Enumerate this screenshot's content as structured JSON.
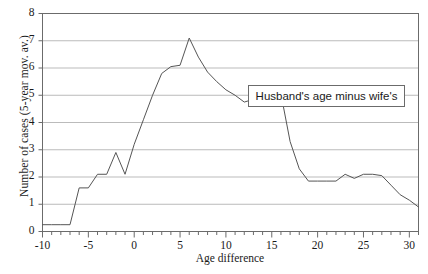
{
  "chart_data": {
    "type": "line",
    "title": "",
    "subtitle": "",
    "xlabel": "Age difference",
    "ylabel": "Number of cases (5-year mov. av.)",
    "xlim": [
      -10,
      31
    ],
    "ylim": [
      0,
      8
    ],
    "xticks": [
      -10,
      -5,
      0,
      5,
      10,
      15,
      20,
      25,
      30
    ],
    "xtick_labels": [
      "-10",
      "-5",
      "0",
      "5",
      "10",
      "15",
      "20",
      "25",
      "30"
    ],
    "x_minor_tick_interval": 1,
    "yticks": [
      0,
      1,
      2,
      3,
      4,
      5,
      6,
      7,
      8
    ],
    "ytick_labels": [
      "0",
      "1",
      "2",
      "3",
      "4",
      "5",
      "6",
      "7",
      "8"
    ],
    "grid": "horizontal",
    "legend": {
      "position": "inside-upper-right",
      "entries": [
        "Husband's age minus wife's"
      ]
    },
    "annotations": [
      {
        "text": "Husband's age minus wife's",
        "x": 20.5,
        "y": 5.05,
        "boxed": true
      }
    ],
    "series": [
      {
        "name": "Husband's age minus wife's",
        "color": "#555555",
        "line_width": 1,
        "x": [
          -10,
          -9,
          -8,
          -7,
          -6,
          -5,
          -4,
          -3,
          -2,
          -1,
          0,
          1,
          2,
          3,
          4,
          5,
          6,
          7,
          8,
          9,
          10,
          11,
          12,
          13,
          14,
          15,
          16,
          17,
          18,
          19,
          20,
          21,
          22,
          23,
          24,
          25,
          26,
          27,
          28,
          29,
          30,
          31
        ],
        "y": [
          0.25,
          0.25,
          0.25,
          0.25,
          1.6,
          1.6,
          2.1,
          2.1,
          2.9,
          2.1,
          3.2,
          4.1,
          5.0,
          5.8,
          6.05,
          6.1,
          7.1,
          6.4,
          5.85,
          5.5,
          5.2,
          5.0,
          4.75,
          4.85,
          5.05,
          5.1,
          5.05,
          3.3,
          2.3,
          1.85,
          1.85,
          1.85,
          1.85,
          2.1,
          1.95,
          2.1,
          2.1,
          2.05,
          1.7,
          1.35,
          1.15,
          0.9
        ]
      }
    ],
    "series_alt_note": "",
    "background": "#ffffff",
    "axis_color": "#6b6b6b",
    "grid_color": "#aaaaaa"
  },
  "axes": {
    "y_label": "Number of cases (5-year mov. av.)",
    "x_label": "Age difference"
  },
  "legend": {
    "label": "Husband's age minus wife's"
  }
}
